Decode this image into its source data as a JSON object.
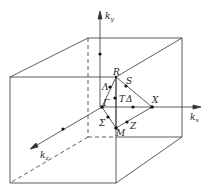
{
  "diagram": {
    "title": "",
    "axes": {
      "kx": "k",
      "kx_sub": "x",
      "ky": "k",
      "ky_sub": "y",
      "kz": "k",
      "kz_sub": "z"
    },
    "points": {
      "Gamma": "Γ",
      "R": "R",
      "X": "X",
      "M": "M",
      "Lambda": "Λ",
      "S": "S",
      "T": "T",
      "Delta": "Δ",
      "Sigma": "Σ",
      "Z": "Z"
    },
    "line_color": "#333333"
  }
}
